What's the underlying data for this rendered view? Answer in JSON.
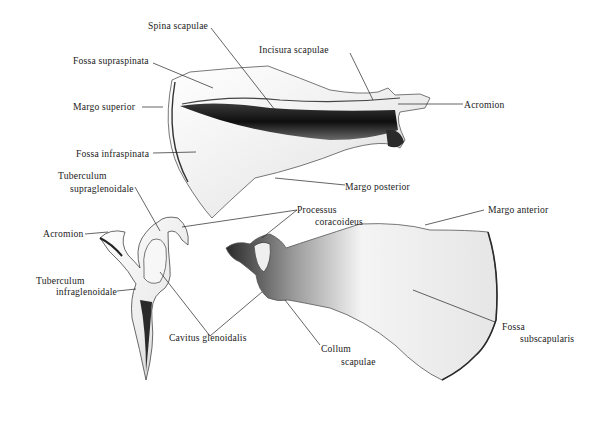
{
  "figure": {
    "background": "#ffffff",
    "ink_color": "#1a1a1a",
    "bone_light": "#f2f2f2",
    "bone_shadow": "#1c1c1c"
  },
  "labels": {
    "spina_scapulae": "Spina scapulae",
    "incisura_scapulae": "Incisura scapulae",
    "fossa_supraspinata": "Fossa supraspinata",
    "margo_superior": "Margo superior",
    "acromion_top": "Acromion",
    "fossa_infraspinata": "Fossa infraspinata",
    "margo_posterior": "Margo posterior",
    "tuberculum_supraglenoidale_1": "Tuberculum",
    "tuberculum_supraglenoidale_2": "supraglenoidale",
    "processus_coracoideus_1": "Processus",
    "processus_coracoideus_2": "coracoideus",
    "margo_anterior": "Margo anterior",
    "acromion_left": "Acromion",
    "tuberculum_infraglenoidale_1": "Tuberculum",
    "tuberculum_infraglenoidale_2": "infraglenoidale",
    "cavitus_glenoidalis": "Cavitus glenoidalis",
    "collum_scapulae_1": "Collum",
    "collum_scapulae_2": "scapulae",
    "fossa_subscapularis_1": "Fossa",
    "fossa_subscapularis_2": "subscapularis"
  }
}
